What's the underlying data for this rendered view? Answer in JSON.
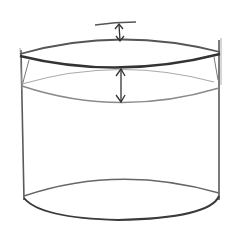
{
  "image": {
    "subject": "pencil sketch of a cylinder with ellipse depth arrows",
    "colors": {
      "background": "#ffffff",
      "pencil_dark": "#3a3a3a",
      "pencil_mid": "#6a6a6a",
      "pencil_light": "#a8a8a8"
    },
    "elements": {
      "top_ellipse": {
        "cx": 118,
        "cy": 57,
        "rx": 100,
        "ry": 14
      },
      "inner_ellipse": {
        "cx": 118,
        "cy": 85,
        "rx": 96,
        "ry": 17
      },
      "bottom_ellipse": {
        "cx": 118,
        "cy": 201,
        "rx": 96,
        "ry": 18
      },
      "left_edge_x": 21,
      "right_edge_x": 219,
      "top_tick": {
        "x1": 95,
        "y1": 24,
        "x2": 136,
        "y2": 22
      },
      "arrow_top": {
        "x": 119,
        "y1": 24,
        "y2": 42
      },
      "arrow_bottom": {
        "x": 121,
        "y1": 68,
        "y2": 102
      }
    }
  }
}
